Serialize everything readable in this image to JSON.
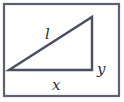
{
  "diagram": {
    "type": "right-triangle-in-frame",
    "labels": {
      "hypotenuse": "l",
      "base": "x",
      "height": "y"
    },
    "colors": {
      "frame": "#5b6172",
      "triangle": "#4a5062",
      "text": "#2b2f3a",
      "background": "#ffffff"
    }
  }
}
